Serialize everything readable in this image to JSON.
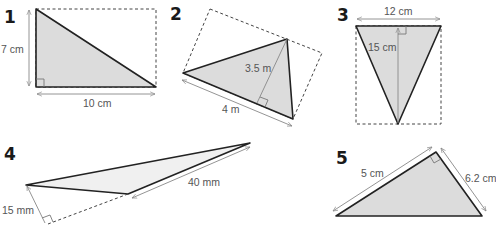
{
  "figures": [
    {
      "number": "1",
      "labels": {
        "height": "7 cm",
        "base": "10 cm"
      }
    },
    {
      "number": "2",
      "labels": {
        "height": "3.5 m",
        "base": "4 m"
      }
    },
    {
      "number": "3",
      "labels": {
        "base": "12 cm",
        "height": "15 cm"
      }
    },
    {
      "number": "4",
      "labels": {
        "height": "15 mm",
        "base": "40 mm"
      }
    },
    {
      "number": "5",
      "labels": {
        "side_a": "5 cm",
        "side_b": "6.2 cm"
      }
    }
  ],
  "colors": {
    "fill": "#dcdcdc",
    "stroke": "#222222",
    "dimension": "#888888"
  }
}
